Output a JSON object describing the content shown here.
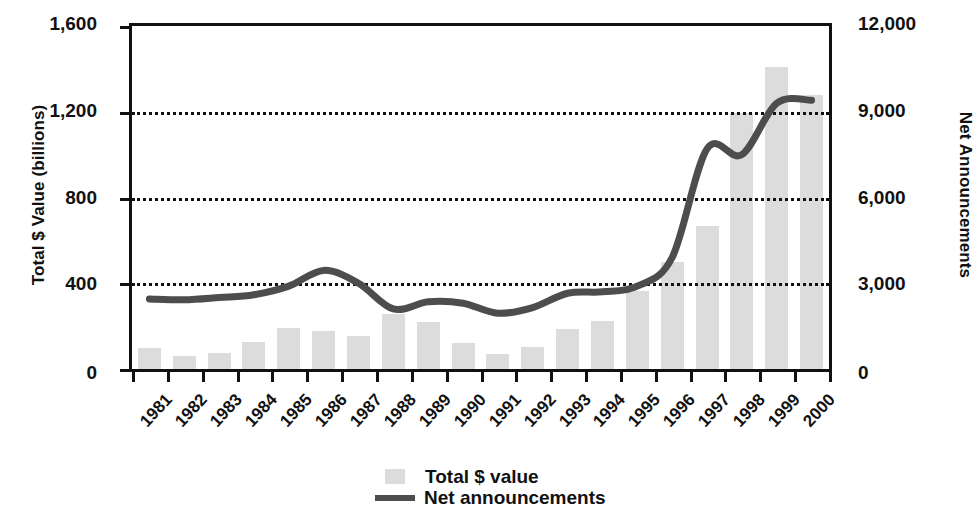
{
  "chart_data": {
    "type": "bar",
    "title": "",
    "categories": [
      "1981",
      "1982",
      "1983",
      "1984",
      "1985",
      "1986",
      "1987",
      "1988",
      "1989",
      "1990",
      "1991",
      "1992",
      "1993",
      "1994",
      "1995",
      "1996",
      "1997",
      "1998",
      "1999",
      "2000"
    ],
    "series": [
      {
        "name": "Total $ value",
        "type": "bar",
        "axis": "left",
        "color": "#dcdcdc",
        "values": [
          100,
          62,
          75,
          125,
          190,
          175,
          155,
          255,
          220,
          120,
          72,
          105,
          185,
          225,
          365,
          500,
          665,
          1195,
          1410,
          1280
        ]
      },
      {
        "name": "Net announcements",
        "type": "line",
        "axis": "right",
        "color": "#4d4d4d",
        "values": [
          2450,
          2420,
          2500,
          2600,
          2900,
          3450,
          3000,
          2100,
          2350,
          2300,
          1950,
          2150,
          2650,
          2700,
          2900,
          3900,
          7700,
          7500,
          9300,
          9400
        ]
      }
    ],
    "xlabel": "",
    "ylabel": "Total $ Value (billions)",
    "y2label": "Net Announcements",
    "ylim": [
      0,
      1600
    ],
    "y2lim": [
      0,
      12000
    ],
    "yticks": [
      "0",
      "400",
      "800",
      "1,200",
      "1,600"
    ],
    "ytick_values": [
      0,
      400,
      800,
      1200,
      1600
    ],
    "y2ticks": [
      "0",
      "3,000",
      "6,000",
      "9,000",
      "12,000"
    ],
    "y2tick_values": [
      0,
      3000,
      6000,
      9000,
      12000
    ],
    "grid": "horizontal-dotted",
    "gridlines_at": [
      400,
      800,
      1200
    ],
    "legend_position": "bottom-center"
  },
  "axes": {
    "left_title": "Total $ Value (billions)",
    "right_title": "Net Announcements",
    "left_ticks": [
      "1,600",
      "1,200",
      "800",
      "400",
      "0"
    ],
    "right_ticks": [
      "12,000",
      "9,000",
      "6,000",
      "3,000",
      "0"
    ]
  },
  "xaxis": {
    "labels": [
      "1981",
      "1982",
      "1983",
      "1984",
      "1985",
      "1986",
      "1987",
      "1988",
      "1989",
      "1990",
      "1991",
      "1992",
      "1993",
      "1994",
      "1995",
      "1996",
      "1997",
      "1998",
      "1999",
      "2000"
    ]
  },
  "legend": {
    "items": [
      {
        "label": "Total $ value",
        "marker": "bar-swatch-icon",
        "color": "#dcdcdc"
      },
      {
        "label": "Net announcements",
        "marker": "line-swatch-icon",
        "color": "#4d4d4d"
      }
    ]
  }
}
